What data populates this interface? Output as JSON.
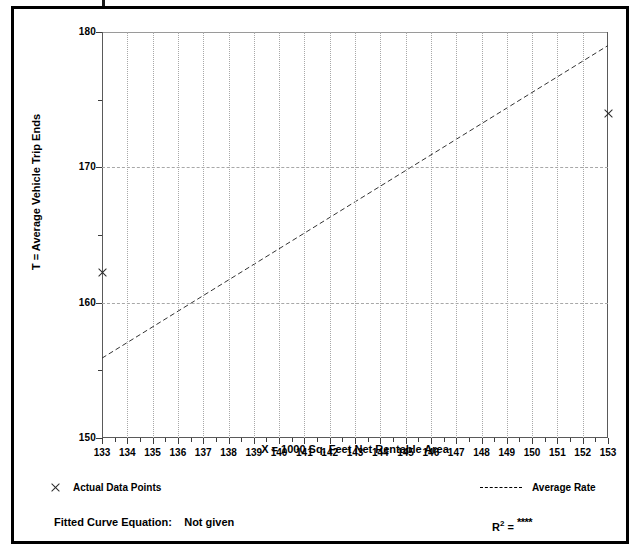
{
  "chart_data": {
    "type": "scatter",
    "title": "",
    "xlabel": "X = 1000 Sq. Feet Net Rentable Area",
    "ylabel": "T = Average Vehicle Trip Ends",
    "xlim": [
      133,
      153
    ],
    "ylim": [
      150,
      180
    ],
    "x_ticks": [
      133,
      134,
      135,
      136,
      137,
      138,
      139,
      140,
      141,
      142,
      143,
      144,
      145,
      146,
      147,
      148,
      149,
      150,
      151,
      152,
      153
    ],
    "y_ticks": [
      150,
      160,
      170,
      180
    ],
    "y_minor_ticks": [
      155,
      165,
      175
    ],
    "grid": "vertical dotted at every x integer; horizontal dashed at 160 and 170",
    "series": [
      {
        "name": "Actual Data Points",
        "type": "scatter",
        "marker": "x",
        "points": [
          {
            "x": 133,
            "y": 162.2
          },
          {
            "x": 153,
            "y": 174.0
          }
        ]
      },
      {
        "name": "Average Rate",
        "type": "line",
        "style": "dashed",
        "points": [
          {
            "x": 133,
            "y": 155.9
          },
          {
            "x": 153,
            "y": 179.0
          }
        ]
      }
    ],
    "legend_position": "below-axes",
    "annotations": {
      "fitted_curve_equation_label": "Fitted Curve Equation:",
      "fitted_curve_equation_value": "Not given",
      "r_squared_label": "R",
      "r_squared_exponent": "2",
      "r_squared_equals": " = ",
      "r_squared_value": "****"
    }
  },
  "axes": {
    "x_title": "X = 1000 Sq. Feet Net Rentable Area",
    "y_title": "T = Average Vehicle Trip Ends",
    "x_tick_labels": [
      "133",
      "134",
      "135",
      "136",
      "137",
      "138",
      "139",
      "140",
      "141",
      "142",
      "143",
      "144",
      "145",
      "146",
      "147",
      "148",
      "149",
      "150",
      "151",
      "152",
      "153"
    ],
    "y_tick_labels": [
      "180",
      "170",
      "160",
      "150"
    ]
  },
  "legend": {
    "data_points_label": "Actual Data Points",
    "average_rate_label": "Average Rate"
  },
  "footer": {
    "equation_label": "Fitted Curve Equation:",
    "equation_value": "Not given",
    "r_label": "R",
    "r_sup": "2",
    "r_eq": " = ",
    "r_value": "****"
  },
  "colors": {
    "frame": "#000000",
    "grid": "#a8a8a8",
    "axis": "#5a5a5a",
    "marker": "#2b2b2b",
    "background": "#ffffff"
  }
}
